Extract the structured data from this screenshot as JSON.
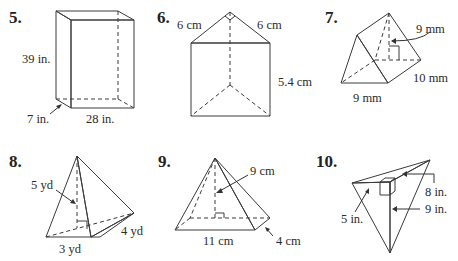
{
  "colors": {
    "face_light": "#dcdcdc",
    "face_mid": "#c4c4c4",
    "face_dark": "#a9a9a9",
    "edge": "#3a3a3a",
    "text": "#2b2b2b"
  },
  "problems": [
    {
      "number": "5.",
      "shape": "rectangular prism",
      "labels": {
        "height": "39 in.",
        "depth": "7 in.",
        "width": "28 in."
      }
    },
    {
      "number": "6.",
      "shape": "triangular prism",
      "labels": {
        "left_leg": "6 cm",
        "right_leg": "6 cm",
        "height": "5.4 cm"
      }
    },
    {
      "number": "7.",
      "shape": "triangular prism",
      "labels": {
        "triangle_height": "9 mm",
        "length": "10 mm",
        "base": "9 mm"
      }
    },
    {
      "number": "8.",
      "shape": "triangular pyramid",
      "labels": {
        "height": "5 yd",
        "base_leg_a": "3 yd",
        "base_leg_b": "4 yd"
      }
    },
    {
      "number": "9.",
      "shape": "rectangular pyramid",
      "labels": {
        "height": "9 cm",
        "base_length": "11 cm",
        "base_width": "4 cm"
      }
    },
    {
      "number": "10.",
      "shape": "triangular pyramid",
      "labels": {
        "base_side": "8 in.",
        "height": "9 in.",
        "other": "5 in."
      }
    }
  ]
}
